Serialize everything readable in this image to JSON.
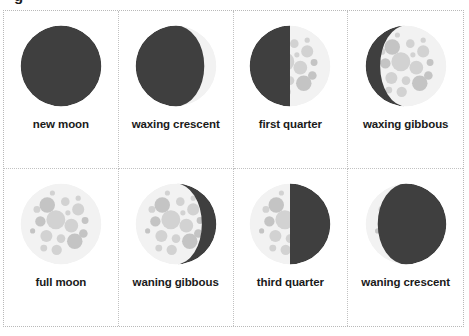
{
  "page": {
    "clipped_title_fragment": "g",
    "background_color": "#ffffff",
    "border_color": "#b9b9b9"
  },
  "colors": {
    "dark_side": "#3f3f3f",
    "lit_surface": "#f2f2f2",
    "crater": "#d2d2d2",
    "crater_dark": "#c4c4c4",
    "label_text": "#1a1a1a"
  },
  "grid": {
    "columns": 4,
    "rows": 2
  },
  "cards": [
    {
      "label": "new moon",
      "phase": "new",
      "illumination": 0,
      "lit_side": "none"
    },
    {
      "label": "waxing crescent",
      "phase": "waxing-crescent",
      "illumination": 0.15,
      "lit_side": "right"
    },
    {
      "label": "first quarter",
      "phase": "first-quarter",
      "illumination": 0.5,
      "lit_side": "right"
    },
    {
      "label": "waxing gibbous",
      "phase": "waxing-gibbous",
      "illumination": 0.82,
      "lit_side": "right"
    },
    {
      "label": "full moon",
      "phase": "full",
      "illumination": 1,
      "lit_side": "both"
    },
    {
      "label": "waning gibbous",
      "phase": "waning-gibbous",
      "illumination": 0.82,
      "lit_side": "left"
    },
    {
      "label": "third quarter",
      "phase": "third-quarter",
      "illumination": 0.5,
      "lit_side": "left"
    },
    {
      "label": "waning crescent",
      "phase": "waning-crescent",
      "illumination": 0.15,
      "lit_side": "left"
    }
  ]
}
